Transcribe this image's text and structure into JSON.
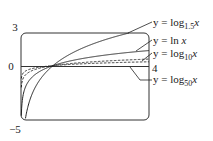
{
  "chart_data": {
    "type": "line",
    "title": "",
    "xlabel": "",
    "ylabel": "",
    "xlim": [
      0,
      4
    ],
    "ylim": [
      -5,
      3
    ],
    "ticks": {
      "y_top": "3",
      "y_zero": "0",
      "y_bottom": "−5",
      "x_right": "4"
    },
    "series": [
      {
        "name": "y = log_1.5 x",
        "base": 1.5,
        "style": "solid"
      },
      {
        "name": "y = ln x",
        "base": 2.718281828,
        "style": "solid"
      },
      {
        "name": "y = log_10 x",
        "base": 10,
        "style": "dashed"
      },
      {
        "name": "y = log_50 x",
        "base": 50,
        "style": "dashed"
      }
    ]
  },
  "labels": {
    "log15": {
      "prefix": "y = log",
      "sub": "1.5",
      "var": "x"
    },
    "ln": {
      "prefix": "y = ln ",
      "var": "x"
    },
    "log10": {
      "prefix": "y = log",
      "sub": "10",
      "var": "x"
    },
    "log50": {
      "prefix": "y = log",
      "sub": "50",
      "var": "x"
    }
  }
}
